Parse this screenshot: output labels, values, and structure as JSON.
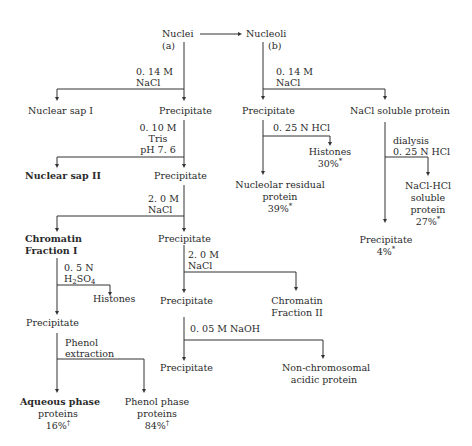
{
  "diagram": {
    "type": "flowchart",
    "branches": {
      "a": {
        "root": "Nuclei",
        "root_tag": "(a)",
        "steps": [
          {
            "reagent": [
              "0. 14 M",
              "NaCl"
            ],
            "left": "Nuclear sap I",
            "down": "Precipitate"
          },
          {
            "reagent": [
              "0. 10 M",
              "Tris",
              "pH 7. 6"
            ],
            "left": "Nuclear sap II",
            "down": "Precipitate"
          },
          {
            "reagent": [
              "2. 0 M",
              "NaCl"
            ],
            "left": [
              "Chromatin",
              "Fraction I"
            ],
            "down": "Precipitate"
          },
          {
            "reagent": [
              "2. 0 M",
              "NaCl"
            ],
            "down": "Precipitate",
            "right": [
              "Chromatin",
              "Fraction II"
            ]
          },
          {
            "reagent": [
              "0. 05 M NaOH"
            ],
            "down": "Precipitate",
            "right": [
              "Non-chromosomal",
              "acidic protein"
            ]
          }
        ],
        "chromatin_fraction_I": {
          "reagent_1": "0. 5 N",
          "reagent_2_prefix": "H",
          "reagent_2_sub1": "2",
          "reagent_2_mid": "SO",
          "reagent_2_sub2": "4",
          "right": "Histones",
          "down": "Precipitate",
          "phenol_reagent": [
            "Phenol",
            "extraction"
          ],
          "aqueous": [
            "Aqueous phase",
            "proteins"
          ],
          "aqueous_pct": "16%",
          "aqueous_mark": "†",
          "phenol": [
            "Phenol phase",
            "proteins"
          ],
          "phenol_pct": "84%",
          "phenol_mark": "†"
        }
      },
      "b": {
        "root": "Nucleoli",
        "root_tag": "(b)",
        "reagent": [
          "0. 14 M",
          "NaCl"
        ],
        "left": "Precipitate",
        "right": "NaCl soluble protein",
        "precipitate_branch": {
          "reagent": "0. 25 N HCl",
          "histones": "Histones",
          "histones_pct": "30%",
          "residual": [
            "Nucleolar residual",
            "protein"
          ],
          "residual_pct": "39%",
          "mark": "*"
        },
        "soluble_branch": {
          "reagent": [
            "dialysis",
            "0. 25 N HCl"
          ],
          "soluble": [
            "NaCl-HCl",
            "soluble",
            "protein"
          ],
          "soluble_pct": "27%",
          "precipitate": "Precipitate",
          "precipitate_pct": "4%",
          "mark": "*"
        }
      }
    }
  }
}
